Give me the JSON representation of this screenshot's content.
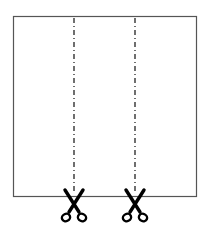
{
  "diagram": {
    "colors": {
      "background": "#ffffff",
      "sheet_stroke": "#555555",
      "cut_line": "#222222",
      "scissors": "#000000"
    },
    "sheet": {
      "x": 13,
      "y": 16,
      "width": 183,
      "height": 180
    },
    "cut_lines": [
      {
        "id": "cut-line-1",
        "x": 74,
        "y_start": 18,
        "y_end": 194,
        "style": "dash-dot"
      },
      {
        "id": "cut-line-2",
        "x": 135,
        "y_start": 18,
        "y_end": 194,
        "style": "dash-dot"
      }
    ],
    "scissors": [
      {
        "id": "scissors-1",
        "icon": "scissors-icon",
        "cx": 74,
        "top": 190
      },
      {
        "id": "scissors-2",
        "icon": "scissors-icon",
        "cx": 135,
        "top": 190
      }
    ]
  }
}
